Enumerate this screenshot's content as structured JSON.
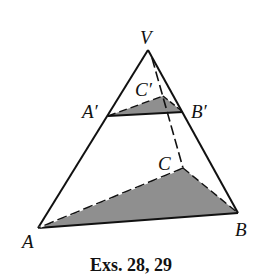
{
  "figure": {
    "caption": "Exs. 28, 29",
    "labels": {
      "V": "V",
      "A_prime": "A′",
      "B_prime": "B′",
      "C_prime": "C′",
      "A": "A",
      "B": "B",
      "C": "C"
    },
    "colors": {
      "stroke": "#111111",
      "shade": "#8f8f8f",
      "background": "#ffffff"
    }
  }
}
